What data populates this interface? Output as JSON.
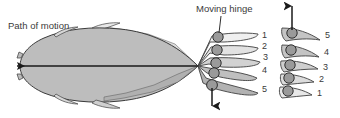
{
  "figure": {
    "title_labels": {
      "path_of_motion": "Path of motion",
      "moving_hinge": "Moving hinge"
    },
    "colors": {
      "background": "#ffffff",
      "body_fill": "#b9b9b9",
      "sweep_fill": "#dcdcdc",
      "light_fill": "#ececec",
      "mid_fill": "#c9c9c9",
      "hinge_fill": "#9a9a9a",
      "outline": "#404040",
      "arrow": "#1a1a1a",
      "text": "#3a3a3a"
    },
    "left_panel": {
      "name": "fish-body-and-fin-sweep",
      "arrow_label": "path-of-motion-arrow",
      "arrow_direction": "left"
    },
    "center_panel": {
      "name": "fin-digits-top-view",
      "digit_numbers": [
        "1",
        "2",
        "3",
        "4",
        "5"
      ],
      "hinge_count": 5,
      "arrow_direction": "down"
    },
    "right_panel": {
      "name": "fin-digits-cross-sections",
      "digit_numbers": [
        "5",
        "4",
        "3",
        "2",
        "1"
      ],
      "hinge_count": 5,
      "arrow_direction": "up"
    }
  }
}
